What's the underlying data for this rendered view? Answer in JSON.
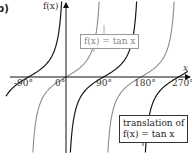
{
  "figure": {
    "part_label": "b)",
    "y_axis_label": "f(x)",
    "x_axis_label": "x"
  },
  "legend": {
    "grey": {
      "label": "f(x) = tan x",
      "color": "#8c8c8c"
    },
    "black": {
      "line1": "translation of",
      "line2": "f(x) = tan x",
      "color": "#1a1a1a"
    }
  },
  "chart_data": {
    "type": "line",
    "title": "",
    "xlabel": "x",
    "ylabel": "f(x)",
    "x_ticks": [
      "-90°",
      "0°",
      "90°",
      "180°",
      "270°"
    ],
    "x_tick_values": [
      -90,
      0,
      90,
      180,
      270
    ],
    "xlim": [
      -105,
      285
    ],
    "grid": false,
    "legend_position": "annotations",
    "series": [
      {
        "name": "f(x) = tan x",
        "color": "#8c8c8c",
        "asymptotes_deg": [
          -90,
          90,
          270
        ],
        "zeros_deg": [
          0,
          180
        ],
        "function": "tan(x)"
      },
      {
        "name": "translation of f(x) = tan x",
        "color": "#1a1a1a",
        "asymptotes_deg": [
          0,
          180
        ],
        "zeros_deg": [
          -90,
          90,
          270
        ],
        "function": "tan(x - 90°)"
      }
    ]
  }
}
